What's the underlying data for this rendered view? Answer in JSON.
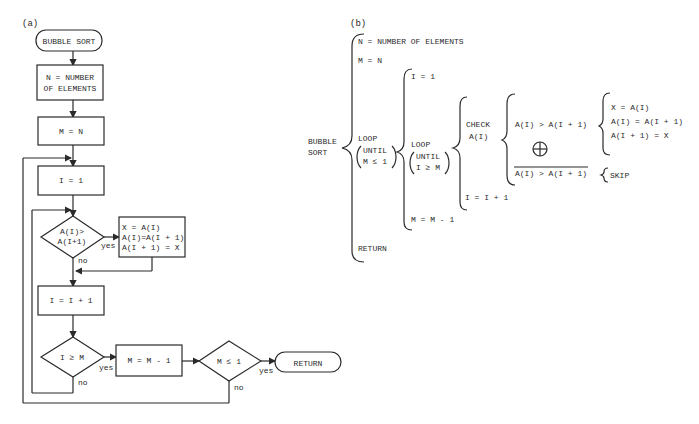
{
  "panel_a": {
    "label": "(a)",
    "start": "BUBBLE SORT",
    "step_n": [
      "N = NUMBER",
      "OF ELEMENTS"
    ],
    "step_m": "M = N",
    "step_i": "I = 1",
    "cond_swap": [
      "A(I)>",
      "A(I+1)"
    ],
    "swap": [
      "X = A(I)",
      "A(I)=A(I + 1)",
      "A(I + 1) = X"
    ],
    "step_inc": "I = I + 1",
    "cond_i": "I ≥ M",
    "step_dec": "M = M - 1",
    "cond_m": "M ≤ 1",
    "end": "RETURN",
    "yes": "yes",
    "no": "no"
  },
  "panel_b": {
    "label": "(b)",
    "root": [
      "BUBBLE",
      "SORT"
    ],
    "l1": {
      "n": "N = NUMBER OF ELEMENTS",
      "m": "M = N",
      "loop": [
        "LOOP",
        "UNTIL",
        "M ≤ 1"
      ],
      "ret": "RETURN"
    },
    "l2": {
      "i": "I = 1",
      "loop": [
        "LOOP",
        "UNTIL",
        "I ≥ M"
      ],
      "dec": "M = M - 1"
    },
    "l3": {
      "check": [
        "CHECK",
        "A(I)"
      ],
      "inc": "I = I + 1"
    },
    "l4": {
      "cond": "A(I) > A(I + 1)",
      "xor": "⊕",
      "notcond": "A(I) > A(I + 1)"
    },
    "l5": {
      "swap": [
        "X = A(I)",
        "A(I) = A(I + 1)",
        "A(I + 1) = X"
      ],
      "skip": "SKIP"
    }
  }
}
